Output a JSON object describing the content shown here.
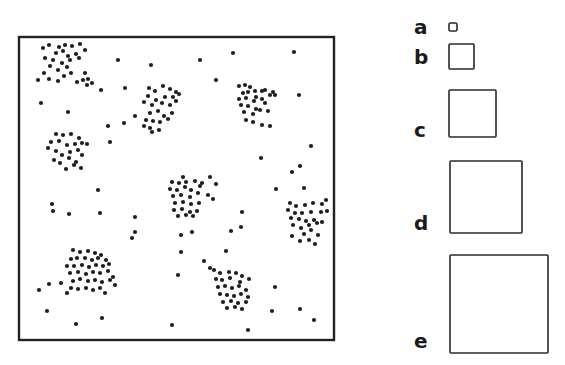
{
  "figure": {
    "frame": {
      "x": 19,
      "y": 37,
      "width": 315,
      "height": 303
    },
    "colors": {
      "dot": "#1e1e1e",
      "stroke": "#222222",
      "background": "#ffffff"
    },
    "dot_radius": 2.1,
    "clusters": [
      {
        "name": "cluster-top-left",
        "points": [
          [
            43,
            48
          ],
          [
            49,
            45
          ],
          [
            59,
            47
          ],
          [
            65,
            45
          ],
          [
            72,
            46
          ],
          [
            80,
            44
          ],
          [
            56,
            53
          ],
          [
            63,
            51
          ],
          [
            68,
            56
          ],
          [
            76,
            54
          ],
          [
            85,
            50
          ],
          [
            45,
            58
          ],
          [
            53,
            60
          ],
          [
            62,
            63
          ],
          [
            70,
            60
          ],
          [
            79,
            58
          ],
          [
            50,
            66
          ],
          [
            58,
            70
          ],
          [
            67,
            67
          ],
          [
            44,
            73
          ],
          [
            49,
            79
          ],
          [
            58,
            81
          ],
          [
            64,
            76
          ],
          [
            71,
            73
          ],
          [
            38,
            80
          ],
          [
            77,
            82
          ],
          [
            83,
            80
          ],
          [
            85,
            73
          ],
          [
            88,
            79
          ],
          [
            87,
            85
          ],
          [
            92,
            83
          ]
        ]
      },
      {
        "name": "cluster-upper-middle",
        "points": [
          [
            149,
            88
          ],
          [
            155,
            91
          ],
          [
            163,
            86
          ],
          [
            170,
            89
          ],
          [
            176,
            92
          ],
          [
            148,
            96
          ],
          [
            156,
            100
          ],
          [
            165,
            97
          ],
          [
            173,
            97
          ],
          [
            179,
            94
          ],
          [
            144,
            102
          ],
          [
            152,
            105
          ],
          [
            162,
            103
          ],
          [
            170,
            105
          ],
          [
            176,
            101
          ],
          [
            150,
            113
          ],
          [
            158,
            111
          ],
          [
            164,
            116
          ],
          [
            172,
            113
          ],
          [
            146,
            120
          ],
          [
            153,
            121
          ],
          [
            144,
            126
          ],
          [
            150,
            128
          ],
          [
            160,
            122
          ],
          [
            168,
            119
          ],
          [
            152,
            132
          ],
          [
            159,
            130
          ]
        ]
      },
      {
        "name": "cluster-upper-right",
        "points": [
          [
            239,
            86
          ],
          [
            245,
            85
          ],
          [
            250,
            87
          ],
          [
            255,
            91
          ],
          [
            262,
            91
          ],
          [
            243,
            93
          ],
          [
            248,
            92
          ],
          [
            256,
            97
          ],
          [
            265,
            90
          ],
          [
            273,
            92
          ],
          [
            239,
            99
          ],
          [
            246,
            98
          ],
          [
            254,
            101
          ],
          [
            262,
            99
          ],
          [
            270,
            95
          ],
          [
            241,
            105
          ],
          [
            248,
            106
          ],
          [
            256,
            109
          ],
          [
            265,
            103
          ],
          [
            275,
            95
          ],
          [
            244,
            112
          ],
          [
            253,
            114
          ],
          [
            260,
            110
          ],
          [
            268,
            111
          ],
          [
            270,
            126
          ],
          [
            246,
            120
          ],
          [
            253,
            122
          ],
          [
            262,
            125
          ]
        ]
      },
      {
        "name": "cluster-left-middle",
        "points": [
          [
            56,
            134
          ],
          [
            63,
            135
          ],
          [
            71,
            134
          ],
          [
            79,
            138
          ],
          [
            51,
            142
          ],
          [
            59,
            141
          ],
          [
            67,
            145
          ],
          [
            75,
            144
          ],
          [
            82,
            143
          ],
          [
            48,
            148
          ],
          [
            56,
            151
          ],
          [
            62,
            155
          ],
          [
            70,
            152
          ],
          [
            78,
            150
          ],
          [
            87,
            144
          ],
          [
            54,
            160
          ],
          [
            60,
            163
          ],
          [
            69,
            158
          ],
          [
            76,
            162
          ],
          [
            82,
            155
          ],
          [
            66,
            169
          ],
          [
            74,
            165
          ],
          [
            81,
            168
          ]
        ]
      },
      {
        "name": "cluster-center",
        "points": [
          [
            172,
            182
          ],
          [
            179,
            183
          ],
          [
            186,
            182
          ],
          [
            195,
            181
          ],
          [
            202,
            183
          ],
          [
            170,
            189
          ],
          [
            177,
            190
          ],
          [
            185,
            187
          ],
          [
            191,
            190
          ],
          [
            200,
            186
          ],
          [
            173,
            196
          ],
          [
            181,
            195
          ],
          [
            190,
            197
          ],
          [
            198,
            193
          ],
          [
            208,
            195
          ],
          [
            175,
            203
          ],
          [
            183,
            202
          ],
          [
            191,
            204
          ],
          [
            199,
            203
          ],
          [
            174,
            210
          ],
          [
            182,
            209
          ],
          [
            190,
            212
          ],
          [
            197,
            211
          ],
          [
            178,
            216
          ],
          [
            186,
            215
          ],
          [
            193,
            216
          ],
          [
            213,
            199
          ],
          [
            183,
            177
          ],
          [
            210,
            177
          ],
          [
            216,
            184
          ]
        ]
      },
      {
        "name": "cluster-right",
        "points": [
          [
            290,
            203
          ],
          [
            296,
            206
          ],
          [
            305,
            205
          ],
          [
            313,
            203
          ],
          [
            322,
            204
          ],
          [
            288,
            210
          ],
          [
            295,
            213
          ],
          [
            302,
            213
          ],
          [
            311,
            212
          ],
          [
            321,
            212
          ],
          [
            291,
            218
          ],
          [
            299,
            219
          ],
          [
            306,
            221
          ],
          [
            314,
            220
          ],
          [
            327,
            211
          ],
          [
            293,
            225
          ],
          [
            301,
            228
          ],
          [
            309,
            225
          ],
          [
            317,
            223
          ],
          [
            304,
            234
          ],
          [
            311,
            230
          ],
          [
            318,
            235
          ],
          [
            292,
            236
          ],
          [
            309,
            240
          ],
          [
            326,
            200
          ],
          [
            300,
            241
          ],
          [
            315,
            244
          ]
        ]
      },
      {
        "name": "cluster-lower-left",
        "points": [
          [
            73,
            250
          ],
          [
            80,
            252
          ],
          [
            88,
            251
          ],
          [
            95,
            253
          ],
          [
            101,
            255
          ],
          [
            71,
            259
          ],
          [
            77,
            258
          ],
          [
            85,
            258
          ],
          [
            92,
            260
          ],
          [
            98,
            258
          ],
          [
            106,
            260
          ],
          [
            67,
            266
          ],
          [
            74,
            266
          ],
          [
            82,
            265
          ],
          [
            89,
            267
          ],
          [
            96,
            265
          ],
          [
            103,
            266
          ],
          [
            109,
            264
          ],
          [
            70,
            273
          ],
          [
            78,
            272
          ],
          [
            86,
            274
          ],
          [
            93,
            272
          ],
          [
            100,
            273
          ],
          [
            108,
            271
          ],
          [
            73,
            281
          ],
          [
            80,
            279
          ],
          [
            88,
            281
          ],
          [
            95,
            280
          ],
          [
            102,
            282
          ],
          [
            110,
            280
          ],
          [
            71,
            288
          ],
          [
            78,
            289
          ],
          [
            86,
            288
          ],
          [
            93,
            290
          ],
          [
            100,
            288
          ],
          [
            105,
            293
          ],
          [
            67,
            293
          ],
          [
            61,
            283
          ],
          [
            113,
            277
          ],
          [
            115,
            285
          ]
        ]
      },
      {
        "name": "cluster-lower-middle",
        "points": [
          [
            214,
            270
          ],
          [
            220,
            273
          ],
          [
            229,
            272
          ],
          [
            236,
            273
          ],
          [
            242,
            276
          ],
          [
            216,
            279
          ],
          [
            222,
            280
          ],
          [
            230,
            278
          ],
          [
            240,
            282
          ],
          [
            249,
            279
          ],
          [
            218,
            287
          ],
          [
            225,
            286
          ],
          [
            232,
            288
          ],
          [
            239,
            286
          ],
          [
            246,
            290
          ],
          [
            220,
            294
          ],
          [
            227,
            295
          ],
          [
            234,
            296
          ],
          [
            241,
            294
          ],
          [
            248,
            297
          ],
          [
            223,
            302
          ],
          [
            231,
            301
          ],
          [
            238,
            303
          ],
          [
            246,
            302
          ],
          [
            227,
            308
          ],
          [
            235,
            307
          ],
          [
            242,
            309
          ],
          [
            210,
            268
          ]
        ]
      }
    ],
    "scattered_points": [
      [
        118,
        60
      ],
      [
        151,
        65
      ],
      [
        200,
        60
      ],
      [
        233,
        53
      ],
      [
        294,
        52
      ],
      [
        41,
        103
      ],
      [
        68,
        112
      ],
      [
        101,
        90
      ],
      [
        125,
        88
      ],
      [
        216,
        80
      ],
      [
        299,
        95
      ],
      [
        108,
        126
      ],
      [
        110,
        142
      ],
      [
        135,
        116
      ],
      [
        124,
        123
      ],
      [
        311,
        146
      ],
      [
        261,
        158
      ],
      [
        300,
        166
      ],
      [
        292,
        172
      ],
      [
        276,
        189
      ],
      [
        304,
        188
      ],
      [
        52,
        204
      ],
      [
        53,
        211
      ],
      [
        98,
        190
      ],
      [
        69,
        214
      ],
      [
        100,
        213
      ],
      [
        135,
        217
      ],
      [
        132,
        238
      ],
      [
        242,
        212
      ],
      [
        231,
        231
      ],
      [
        241,
        227
      ],
      [
        322,
        222
      ],
      [
        181,
        235
      ],
      [
        181,
        252
      ],
      [
        178,
        275
      ],
      [
        204,
        261
      ],
      [
        226,
        251
      ],
      [
        172,
        325
      ],
      [
        49,
        284
      ],
      [
        39,
        290
      ],
      [
        47,
        311
      ],
      [
        76,
        324
      ],
      [
        102,
        318
      ],
      [
        275,
        287
      ],
      [
        314,
        320
      ],
      [
        272,
        311
      ],
      [
        300,
        309
      ],
      [
        248,
        330
      ],
      [
        192,
        232
      ],
      [
        135,
        232
      ]
    ],
    "legend": {
      "items": [
        {
          "label": "a",
          "square": {
            "x": 449,
            "y": 23,
            "size": 8
          },
          "label_pos": {
            "x": 414,
            "y": 17
          }
        },
        {
          "label": "b",
          "square": {
            "x": 449,
            "y": 44,
            "size": 25
          },
          "label_pos": {
            "x": 414,
            "y": 47
          }
        },
        {
          "label": "c",
          "square": {
            "x": 449,
            "y": 90,
            "size": 47
          },
          "label_pos": {
            "x": 414,
            "y": 120
          }
        },
        {
          "label": "d",
          "square": {
            "x": 450,
            "y": 161,
            "size": 72
          },
          "label_pos": {
            "x": 414,
            "y": 213
          }
        },
        {
          "label": "e",
          "square": {
            "x": 450,
            "y": 255,
            "size": 98
          },
          "label_pos": {
            "x": 414,
            "y": 331
          }
        }
      ]
    }
  }
}
